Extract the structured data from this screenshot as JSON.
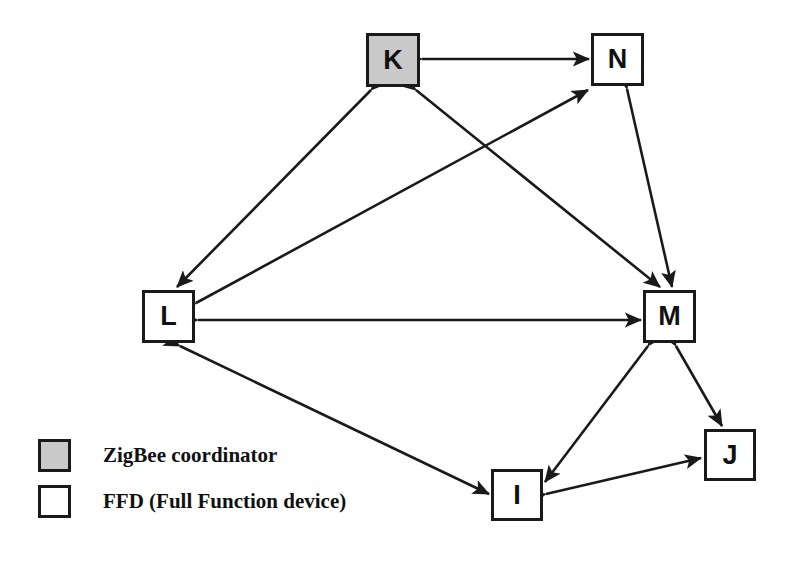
{
  "figure": {
    "type": "network-topology-diagram",
    "background_color": "#ffffff",
    "line_color": "#1a1a1a",
    "coordinator_fill": "#c9c9c9",
    "ffd_fill": "#ffffff"
  },
  "nodes": [
    {
      "id": "K",
      "label": "K",
      "role": "ZigBee coordinator",
      "fill": "#c9c9c9",
      "x": 366,
      "y": 33,
      "w": 54,
      "h": 54
    },
    {
      "id": "N",
      "label": "N",
      "role": "FFD (Full Function device)",
      "fill": "#ffffff",
      "x": 591,
      "y": 33,
      "w": 53,
      "h": 53
    },
    {
      "id": "L",
      "label": "L",
      "role": "FFD (Full Function device)",
      "fill": "#ffffff",
      "x": 142,
      "y": 290,
      "w": 53,
      "h": 53
    },
    {
      "id": "M",
      "label": "M",
      "role": "FFD (Full Function device)",
      "fill": "#ffffff",
      "x": 643,
      "y": 290,
      "w": 53,
      "h": 53
    },
    {
      "id": "J",
      "label": "J",
      "role": "FFD (Full Function device)",
      "fill": "#ffffff",
      "x": 704,
      "y": 429,
      "w": 52,
      "h": 52
    },
    {
      "id": "I",
      "label": "I",
      "role": "FFD (Full Function device)",
      "fill": "#ffffff",
      "x": 491,
      "y": 469,
      "w": 52,
      "h": 52
    }
  ],
  "edges": [
    {
      "from": "K",
      "to": "N",
      "direction": "bidirectional"
    },
    {
      "from": "K",
      "to": "L",
      "direction": "bidirectional"
    },
    {
      "from": "K",
      "to": "M",
      "direction": "bidirectional"
    },
    {
      "from": "L",
      "to": "N",
      "direction": "bidirectional"
    },
    {
      "from": "L",
      "to": "M",
      "direction": "bidirectional"
    },
    {
      "from": "L",
      "to": "I",
      "direction": "bidirectional"
    },
    {
      "from": "N",
      "to": "M",
      "direction": "bidirectional"
    },
    {
      "from": "M",
      "to": "I",
      "direction": "bidirectional"
    },
    {
      "from": "M",
      "to": "J",
      "direction": "bidirectional"
    },
    {
      "from": "I",
      "to": "J",
      "direction": "bidirectional"
    }
  ],
  "legend": {
    "items": [
      {
        "swatch": "coordinator",
        "label": "ZigBee coordinator"
      },
      {
        "swatch": "ffd",
        "label": "FFD (Full Function device)"
      }
    ]
  }
}
